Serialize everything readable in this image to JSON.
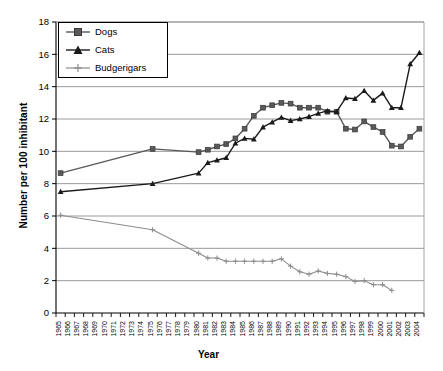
{
  "chart_data": {
    "type": "line",
    "title": "",
    "xlabel": "Year",
    "ylabel": "Number per 100 inhibitant",
    "ylim": [
      0,
      18
    ],
    "ytick_step": 2,
    "yticks": [
      "0",
      "2",
      "4",
      "6",
      "8",
      "10",
      "12",
      "14",
      "16",
      "18"
    ],
    "grid": true,
    "legend_position": "top-left",
    "categories": [
      "1965",
      "1966",
      "1967",
      "1968",
      "1969",
      "1970",
      "1971",
      "1972",
      "1973",
      "1974",
      "1975",
      "1976",
      "1977",
      "1978",
      "1979",
      "1980",
      "1981",
      "1982",
      "1983",
      "1984",
      "1985",
      "1986",
      "1987",
      "1988",
      "1989",
      "1990",
      "1991",
      "1992",
      "1993",
      "1994",
      "1995",
      "1996",
      "1997",
      "1998",
      "1999",
      "2000",
      "2001",
      "2002",
      "2003",
      "2004"
    ],
    "series": [
      {
        "name": "Dogs",
        "color": "#595959",
        "marker": "square",
        "values": [
          8.65,
          null,
          null,
          null,
          null,
          null,
          null,
          null,
          null,
          null,
          10.15,
          null,
          null,
          null,
          null,
          9.95,
          10.1,
          10.3,
          10.45,
          10.8,
          11.4,
          12.2,
          12.7,
          12.85,
          13.0,
          12.95,
          12.7,
          12.7,
          12.7,
          12.45,
          12.45,
          11.4,
          11.35,
          11.85,
          11.5,
          11.2,
          10.35,
          10.3,
          10.9,
          11.4
        ]
      },
      {
        "name": "Cats",
        "color": "#1a1a1a",
        "marker": "triangle",
        "values": [
          7.5,
          null,
          null,
          null,
          null,
          null,
          null,
          null,
          null,
          null,
          8.0,
          null,
          null,
          null,
          null,
          8.65,
          9.3,
          9.45,
          9.6,
          10.5,
          10.8,
          10.75,
          11.5,
          11.8,
          12.1,
          11.9,
          12.0,
          12.15,
          12.35,
          12.5,
          12.45,
          13.3,
          13.25,
          13.75,
          13.15,
          13.6,
          12.7,
          12.7,
          15.4,
          16.1
        ]
      },
      {
        "name": "Budgerigars",
        "color": "#8c8c8c",
        "marker": "plus",
        "values": [
          6.05,
          null,
          null,
          null,
          null,
          null,
          null,
          null,
          null,
          null,
          5.15,
          null,
          null,
          null,
          null,
          3.7,
          3.4,
          3.4,
          3.2,
          3.2,
          3.2,
          3.2,
          3.2,
          3.2,
          3.35,
          2.9,
          2.55,
          2.4,
          2.6,
          2.45,
          2.4,
          2.25,
          1.95,
          2.0,
          1.75,
          1.75,
          1.4,
          null,
          null,
          null
        ]
      }
    ]
  },
  "legend": {
    "items": [
      {
        "label": "Dogs"
      },
      {
        "label": "Cats"
      },
      {
        "label": "Budgerigars"
      }
    ]
  },
  "axes": {
    "x_title": "Year",
    "y_title": "Number per 100 inhibitant"
  }
}
